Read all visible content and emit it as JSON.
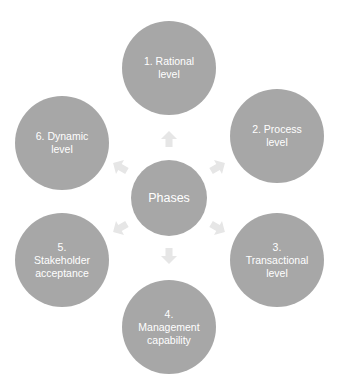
{
  "diagram": {
    "type": "radial-cycle",
    "center": {
      "label": "Phases"
    },
    "nodes": [
      {
        "id": 1,
        "label": "1. Rational\nlevel"
      },
      {
        "id": 2,
        "label": "2. Process\nlevel"
      },
      {
        "id": 3,
        "label": "3.\nTransactional\nlevel"
      },
      {
        "id": 4,
        "label": "4.\nManagement\ncapability"
      },
      {
        "id": 5,
        "label": "5.\nStakeholder\nacceptance"
      },
      {
        "id": 6,
        "label": "6. Dynamic\nlevel"
      }
    ],
    "colors": {
      "circle": "#a7a7a7",
      "arrow": "#e6e6e6",
      "text": "#ffffff",
      "background": "#ffffff"
    }
  }
}
